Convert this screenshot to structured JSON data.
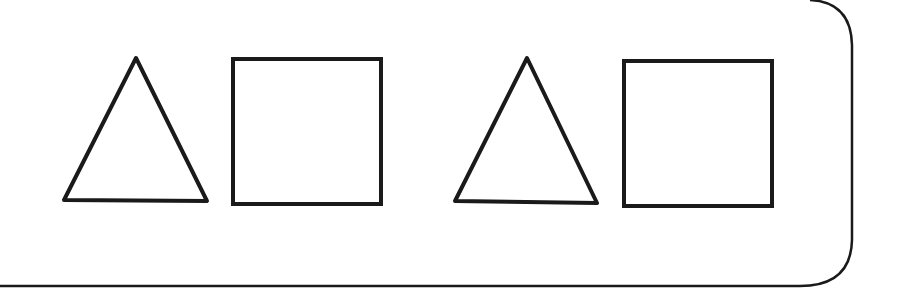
{
  "diagram": {
    "stroke_color": "#1a1a1a",
    "background": "#ffffff",
    "shapes": [
      {
        "type": "triangle",
        "points": "136,58 207,201 64,200"
      },
      {
        "type": "square",
        "x": 233,
        "y": 59,
        "w": 148,
        "h": 145
      },
      {
        "type": "triangle",
        "points": "527,58 597,203 455,201"
      },
      {
        "type": "square",
        "x": 624,
        "y": 61,
        "w": 148,
        "h": 145
      }
    ],
    "pattern": [
      "triangle",
      "square",
      "triangle",
      "square"
    ]
  }
}
